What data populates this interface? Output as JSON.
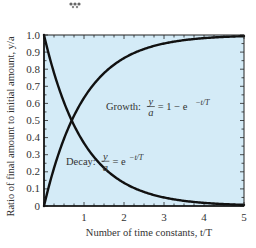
{
  "chart_data": {
    "type": "line",
    "title": "",
    "xlabel": "Number of time constants, t/T",
    "ylabel": "Ratio of final amount to initial amount, y/a",
    "xlim": [
      0,
      5
    ],
    "ylim": [
      0,
      1.0
    ],
    "x_ticks": [
      1,
      2,
      3,
      4,
      5
    ],
    "x_tick_labels": [
      "1",
      "2",
      "3",
      "4",
      "5"
    ],
    "y_ticks": [
      0,
      0.1,
      0.2,
      0.3,
      0.4,
      0.5,
      0.6,
      0.7,
      0.8,
      0.9,
      1.0
    ],
    "y_tick_labels": [
      "0",
      "0.1",
      "0.2",
      "0.3",
      "0.4",
      "0.5",
      "0.6",
      "0.7",
      "0.8",
      "0.9",
      "1.0"
    ],
    "grid": false,
    "background_color": "#d4ebf7",
    "line_color": "#111111",
    "series": [
      {
        "name": "Growth",
        "formula": "y/a = 1 - e^(-t/T)",
        "x": [
          0,
          0.25,
          0.5,
          0.693,
          1,
          1.5,
          2,
          2.5,
          3,
          3.5,
          4,
          4.5,
          5
        ],
        "values": [
          0,
          0.221,
          0.393,
          0.5,
          0.632,
          0.777,
          0.865,
          0.918,
          0.95,
          0.97,
          0.982,
          0.989,
          0.993
        ]
      },
      {
        "name": "Decay",
        "formula": "y/a = e^(-t/T)",
        "x": [
          0,
          0.25,
          0.5,
          0.693,
          1,
          1.5,
          2,
          2.5,
          3,
          3.5,
          4,
          4.5,
          5
        ],
        "values": [
          1,
          0.779,
          0.607,
          0.5,
          0.368,
          0.223,
          0.135,
          0.082,
          0.05,
          0.03,
          0.018,
          0.011,
          0.007
        ]
      }
    ],
    "annotations": [
      {
        "label": "Growth:",
        "lhs_num": "y",
        "lhs_den": "a",
        "rhs": "= 1 − e",
        "exp": "−t/T",
        "at": [
          2.5,
          0.58
        ]
      },
      {
        "label": "Decay:",
        "lhs_num": "y",
        "lhs_den": "a",
        "rhs": "= e",
        "exp": "−t/T",
        "at": [
          1.5,
          0.26
        ]
      }
    ]
  }
}
